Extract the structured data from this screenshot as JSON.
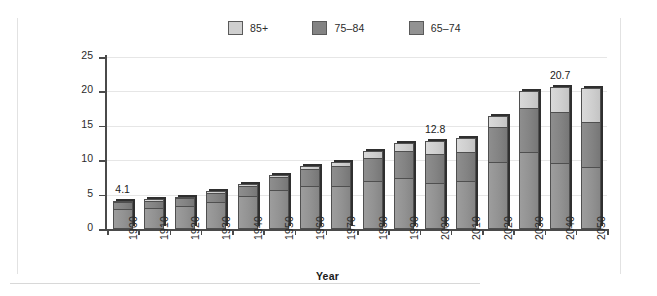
{
  "chart_data": {
    "type": "bar",
    "subtype": "stacked-vertical",
    "title": "",
    "xlabel": "Year",
    "ylabel": "Percent of population",
    "ylim": [
      0,
      25
    ],
    "yticks": [
      0,
      5,
      10,
      15,
      20,
      25
    ],
    "grid": true,
    "legend_position": "top-center",
    "categories": [
      "1900",
      "1910",
      "1920",
      "1930",
      "1940",
      "1950",
      "1960",
      "1970",
      "1980",
      "1990",
      "2000",
      "2010",
      "2020",
      "2030",
      "2040",
      "2050"
    ],
    "series": [
      {
        "name": "65–74",
        "color": "#929292",
        "values": [
          2.9,
          3.0,
          3.3,
          3.9,
          4.8,
          5.6,
          6.1,
          6.1,
          6.9,
          7.3,
          6.5,
          6.9,
          9.6,
          11.0,
          9.4,
          8.9
        ]
      },
      {
        "name": "75–84",
        "color": "#838383",
        "values": [
          1.0,
          1.1,
          1.2,
          1.3,
          1.5,
          1.9,
          2.6,
          3.0,
          3.4,
          4.0,
          4.4,
          4.3,
          5.2,
          6.5,
          7.5,
          6.6
        ]
      },
      {
        "name": "85+",
        "color": "#cfcfcf",
        "values": [
          0.2,
          0.2,
          0.2,
          0.3,
          0.3,
          0.4,
          0.5,
          0.7,
          1.0,
          1.2,
          1.9,
          2.0,
          1.6,
          2.5,
          3.8,
          5.0
        ]
      }
    ],
    "totals": [
      4.1,
      4.3,
      4.7,
      5.5,
      6.6,
      7.9,
      9.2,
      9.8,
      11.3,
      12.5,
      12.8,
      13.2,
      16.4,
      20.0,
      20.7,
      20.5
    ],
    "annotations": [
      {
        "category": "1900",
        "text": "4.1"
      },
      {
        "category": "2000",
        "text": "12.8"
      },
      {
        "category": "2040",
        "text": "20.7"
      }
    ]
  },
  "legend": {
    "items": [
      {
        "label": "85+",
        "color": "#cfcfcf"
      },
      {
        "label": "75–84",
        "color": "#838383"
      },
      {
        "label": "65–74",
        "color": "#929292"
      }
    ]
  },
  "axes": {
    "y_title": "Percent of population",
    "x_title": "Year"
  }
}
